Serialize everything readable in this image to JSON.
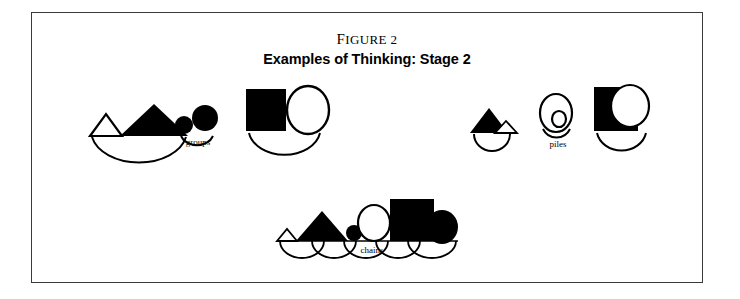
{
  "figure": {
    "number_label": "Figure 2",
    "number_lead": "F",
    "number_rest": "IGURE",
    "number_value": "2",
    "title": "Examples of Thinking: Stage 2",
    "border_color": "#3a3a3a",
    "ink_color": "#000000",
    "background_color": "#ffffff"
  },
  "clusters": [
    {
      "id": "groups",
      "label": "groups",
      "description": "Three groupings of like shapes: triangles, circles, and a square with a circle",
      "items": [
        {
          "name": "triangle-group",
          "shapes": [
            {
              "type": "triangle",
              "fill": "none",
              "stroke": "#000000",
              "size": "small"
            },
            {
              "type": "triangle",
              "fill": "#000000",
              "stroke": "none",
              "size": "large"
            }
          ],
          "arc": true
        },
        {
          "name": "circle-group",
          "shapes": [
            {
              "type": "circle",
              "fill": "#000000",
              "stroke": "none",
              "size": "small"
            },
            {
              "type": "circle",
              "fill": "#000000",
              "stroke": "none",
              "size": "medium"
            }
          ],
          "arc": true
        },
        {
          "name": "square-circle-group",
          "shapes": [
            {
              "type": "square",
              "fill": "#000000",
              "stroke": "none",
              "size": "large"
            },
            {
              "type": "circle",
              "fill": "none",
              "stroke": "#000000",
              "size": "large"
            }
          ],
          "arc": true
        }
      ]
    },
    {
      "id": "piles",
      "label": "piles",
      "description": "Three piles of overlapping shapes",
      "items": [
        {
          "name": "triangle-pile",
          "shapes": [
            {
              "type": "triangle",
              "fill": "#000000",
              "stroke": "none",
              "size": "large"
            },
            {
              "type": "triangle",
              "fill": "#ffffff",
              "stroke": "#000000",
              "size": "small"
            }
          ],
          "arc": true
        },
        {
          "name": "circle-pile",
          "shapes": [
            {
              "type": "circle",
              "fill": "none",
              "stroke": "#000000",
              "size": "large"
            },
            {
              "type": "circle",
              "fill": "none",
              "stroke": "#000000",
              "size": "small"
            }
          ],
          "arc": true
        },
        {
          "name": "square-circle-pile",
          "shapes": [
            {
              "type": "square",
              "fill": "#000000",
              "stroke": "none",
              "size": "large"
            },
            {
              "type": "circle",
              "fill": "#ffffff",
              "stroke": "#000000",
              "size": "large"
            }
          ],
          "arc": true
        }
      ]
    },
    {
      "id": "chains",
      "label": "chains",
      "description": "A linked chain of six shapes joined by overlapping arcs",
      "items": [
        {
          "name": "chain-shape-1",
          "type": "triangle",
          "fill": "none",
          "stroke": "#000000",
          "size": "small"
        },
        {
          "name": "chain-shape-2",
          "type": "triangle",
          "fill": "#000000",
          "stroke": "none",
          "size": "large"
        },
        {
          "name": "chain-shape-3",
          "type": "circle",
          "fill": "#000000",
          "stroke": "none",
          "size": "small"
        },
        {
          "name": "chain-shape-4",
          "type": "circle",
          "fill": "none",
          "stroke": "#000000",
          "size": "large"
        },
        {
          "name": "chain-shape-5",
          "type": "square",
          "fill": "#000000",
          "stroke": "none",
          "size": "large"
        },
        {
          "name": "chain-shape-6",
          "type": "circle",
          "fill": "#000000",
          "stroke": "none",
          "size": "large"
        }
      ],
      "arc_count": 5
    }
  ]
}
